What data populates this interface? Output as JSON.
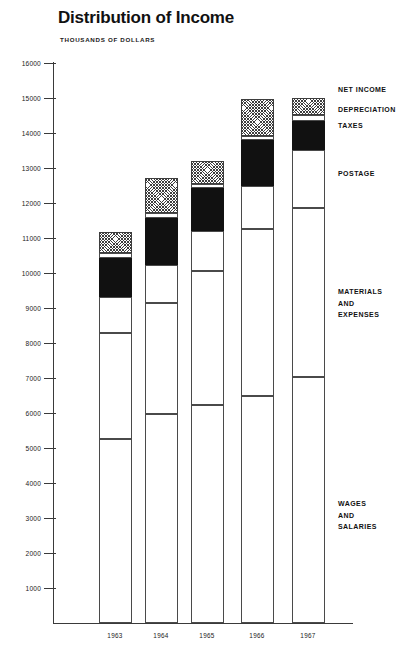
{
  "chart_data": {
    "type": "bar",
    "title": "Distribution of Income",
    "subtitle": "THOUSANDS OF DOLLARS",
    "xlabel": "",
    "ylabel": "THOUSANDS OF DOLLARS",
    "stacked": true,
    "grid": false,
    "legend_position": "right",
    "ylim": [
      0,
      16000
    ],
    "yticks": [
      1000,
      2000,
      3000,
      4000,
      5000,
      6000,
      7000,
      8000,
      9000,
      10000,
      11000,
      12000,
      13000,
      14000,
      15000,
      16000
    ],
    "ytick_labels": [
      "1000",
      "2000",
      "3000",
      "4000",
      "5000",
      "6000",
      "7000",
      "8000",
      "9000",
      "10000",
      "11000",
      "12000",
      "13000",
      "14000",
      "15000",
      "16000"
    ],
    "categories": [
      "1963",
      "1964",
      "1965",
      "1966",
      "1967"
    ],
    "series": [
      {
        "name": "WAGES AND SALARIES",
        "fill": "white",
        "values": [
          5270,
          5980,
          6230,
          6500,
          7030
        ]
      },
      {
        "name": "MATERIALS AND EXPENSES",
        "fill": "white",
        "values": [
          3030,
          3190,
          3850,
          4770,
          4850
        ]
      },
      {
        "name": "POSTAGE",
        "fill": "white",
        "values": [
          1030,
          1060,
          1120,
          1240,
          1630
        ]
      },
      {
        "name": "TAXES",
        "fill": "black",
        "values": [
          1120,
          1360,
          1230,
          1300,
          820
        ]
      },
      {
        "name": "DEPRECIATION",
        "fill": "white",
        "values": [
          130,
          130,
          130,
          130,
          170
        ]
      },
      {
        "name": "NET INCOME",
        "fill": "hatch",
        "values": [
          620,
          1010,
          660,
          1050,
          510
        ]
      }
    ],
    "totals": [
      11200,
      12730,
      13220,
      14990,
      15010
    ],
    "segment_boundaries": {
      "1963": [
        5270,
        8300,
        9330,
        10450,
        10580,
        11200
      ],
      "1964": [
        5980,
        9170,
        10230,
        11590,
        11720,
        12730
      ],
      "1965": [
        6230,
        10080,
        11200,
        12430,
        12560,
        13220
      ],
      "1966": [
        6500,
        11270,
        12510,
        13810,
        13940,
        14990
      ],
      "1967": [
        7030,
        11880,
        13540,
        14360,
        14530,
        15010
      ]
    }
  },
  "legend": {
    "items": [
      {
        "key": "net-income",
        "label": "NET INCOME",
        "swatch": "hatch"
      },
      {
        "key": "depreciation",
        "label": "DEPRECIATION",
        "swatch": "white"
      },
      {
        "key": "taxes",
        "label": "TAXES",
        "swatch": "black"
      },
      {
        "key": "postage",
        "label": "POSTAGE",
        "swatch": "white"
      },
      {
        "key": "materials-and-expenses",
        "label": "MATERIALS\nAND\nEXPENSES",
        "swatch": "white"
      },
      {
        "key": "wages-and-salaries",
        "label": "WAGES\nAND\nSALARIES",
        "swatch": "white"
      }
    ]
  }
}
